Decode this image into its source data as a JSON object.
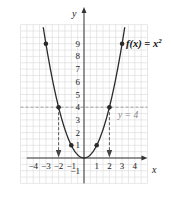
{
  "chart_data": {
    "type": "line",
    "title": "",
    "function_label": "f(x) = x",
    "function_exponent": "2",
    "xlabel": "x",
    "ylabel": "y",
    "xlim": [
      -4.5,
      4.5
    ],
    "ylim": [
      -2,
      10.5
    ],
    "grid": true,
    "x_ticks": [
      -4,
      -3,
      -2,
      -1,
      1,
      2,
      3,
      4
    ],
    "x_tick_labels": [
      "−4",
      "−3",
      "−2",
      "−1",
      "1",
      "2",
      "3",
      "4"
    ],
    "y_ticks": [
      -1,
      1,
      2,
      3,
      4,
      5,
      6,
      7,
      8,
      9
    ],
    "y_tick_labels": [
      "−1",
      "1",
      "2",
      "3",
      "4",
      "5",
      "6",
      "7",
      "8",
      "9"
    ],
    "series": [
      {
        "name": "f(x) = x^2",
        "x": [
          -3,
          -2,
          -1,
          0,
          1,
          2,
          3
        ],
        "y": [
          9,
          4,
          1,
          0,
          1,
          4,
          9
        ],
        "marked_points": [
          [
            -3,
            9
          ],
          [
            -2,
            4
          ],
          [
            -1,
            1
          ],
          [
            1,
            1
          ],
          [
            2,
            4
          ],
          [
            3,
            9
          ]
        ]
      }
    ],
    "annotations": [
      {
        "type": "horizontal_dashed_line",
        "y": 4,
        "label": "y = 4",
        "color": "#999999"
      },
      {
        "type": "vertical_dashed_arrow",
        "from": [
          -2,
          4
        ],
        "to": [
          -2,
          0
        ]
      },
      {
        "type": "vertical_dashed_arrow",
        "from": [
          2,
          4
        ],
        "to": [
          2,
          0
        ]
      }
    ]
  },
  "colors": {
    "curve": "#2a2a2a",
    "grid": "#d8d8d8",
    "axis": "#333333",
    "dashed_line": "#999999",
    "arrow": "#444444"
  }
}
